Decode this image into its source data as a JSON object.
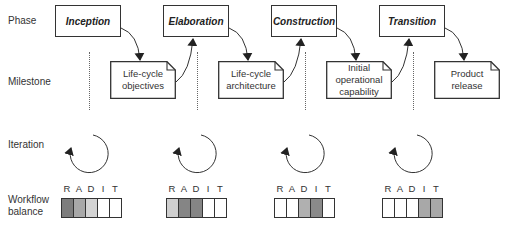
{
  "rows": {
    "phase": "Phase",
    "milestone": "Milestone",
    "iteration": "Iteration",
    "workflow_balance": "Workflow\nbalance"
  },
  "phases": [
    {
      "label": "Inception",
      "milestone": "Life-cycle\nobjectives",
      "balance": {
        "letters": [
          "R",
          "A",
          "D",
          "I",
          "T"
        ],
        "shades": [
          "#7d7d7d",
          "#a8a8a8",
          "#d4d4d4",
          "#ffffff",
          "#ffffff"
        ]
      }
    },
    {
      "label": "Elaboration",
      "milestone": "Life-cycle\narchitecture",
      "balance": {
        "letters": [
          "R",
          "A",
          "D",
          "I",
          "T"
        ],
        "shades": [
          "#cfcfcf",
          "#858585",
          "#858585",
          "#ffffff",
          "#ffffff"
        ]
      }
    },
    {
      "label": "Construction",
      "milestone": "Initial\noperational\ncapability",
      "balance": {
        "letters": [
          "R",
          "A",
          "D",
          "I",
          "T"
        ],
        "shades": [
          "#ffffff",
          "#ffffff",
          "#b0b0b0",
          "#8a8a8a",
          "#ffffff"
        ]
      }
    },
    {
      "label": "Transition",
      "milestone": "Product\nrelease",
      "balance": {
        "letters": [
          "R",
          "A",
          "D",
          "I",
          "T"
        ],
        "shades": [
          "#ffffff",
          "#ffffff",
          "#ffffff",
          "#a8a8a8",
          "#a8a8a8"
        ]
      }
    }
  ],
  "colors": {
    "stroke": "#333333",
    "background": "#ffffff"
  }
}
